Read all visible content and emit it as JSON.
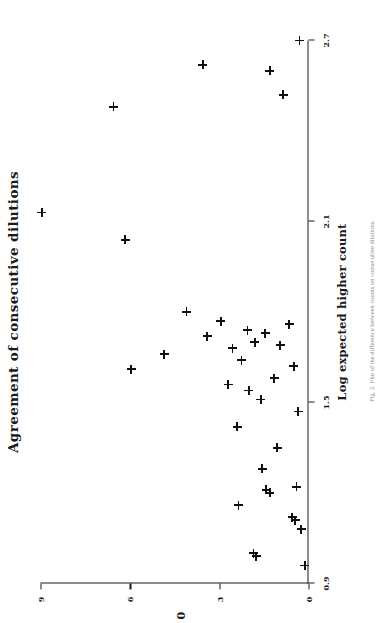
{
  "figure": {
    "title": "Agreement of consecutive dilutions",
    "x_axis_title": "Log expected higher count",
    "y_axis_title": "0",
    "caption_fragment": "Fig. 2. Plot of the difference between counts on consecutive dilutions."
  },
  "chart_data": {
    "type": "scatter",
    "title": "Agreement of consecutive dilutions",
    "xlabel": "Log expected higher count",
    "ylabel": "0",
    "xlim": [
      0.9,
      2.7
    ],
    "ylim": [
      0,
      9
    ],
    "xticks": [
      0.9,
      1.5,
      2.1,
      2.7
    ],
    "xticklabels": [
      "0.9",
      "1.5",
      "2.1",
      "2.7"
    ],
    "yticks": [
      0,
      3,
      6,
      9
    ],
    "yticklabels": [
      "0",
      "3",
      "6",
      "9"
    ],
    "grid": false,
    "legend": null,
    "marker": "plus",
    "marker_color": "#111111",
    "n_points": 38,
    "points": [
      {
        "x": 2.7,
        "y": 0.3
      },
      {
        "x": 2.62,
        "y": 3.55
      },
      {
        "x": 2.6,
        "y": 1.3
      },
      {
        "x": 2.52,
        "y": 0.85
      },
      {
        "x": 2.48,
        "y": 6.55
      },
      {
        "x": 2.13,
        "y": 8.95
      },
      {
        "x": 2.04,
        "y": 6.15
      },
      {
        "x": 1.8,
        "y": 4.1
      },
      {
        "x": 1.77,
        "y": 2.95
      },
      {
        "x": 1.76,
        "y": 0.65
      },
      {
        "x": 1.74,
        "y": 2.05
      },
      {
        "x": 1.73,
        "y": 1.45
      },
      {
        "x": 1.72,
        "y": 3.4
      },
      {
        "x": 1.7,
        "y": 1.8
      },
      {
        "x": 1.69,
        "y": 0.95
      },
      {
        "x": 1.68,
        "y": 2.55
      },
      {
        "x": 1.66,
        "y": 4.85
      },
      {
        "x": 1.64,
        "y": 2.25
      },
      {
        "x": 1.62,
        "y": 0.5
      },
      {
        "x": 1.61,
        "y": 5.95
      },
      {
        "x": 1.58,
        "y": 1.15
      },
      {
        "x": 1.56,
        "y": 2.7
      },
      {
        "x": 1.54,
        "y": 2.0
      },
      {
        "x": 1.51,
        "y": 1.6
      },
      {
        "x": 1.47,
        "y": 0.35
      },
      {
        "x": 1.42,
        "y": 2.4
      },
      {
        "x": 1.35,
        "y": 1.05
      },
      {
        "x": 1.28,
        "y": 1.55
      },
      {
        "x": 1.22,
        "y": 0.4
      },
      {
        "x": 1.21,
        "y": 1.42
      },
      {
        "x": 1.2,
        "y": 1.3
      },
      {
        "x": 1.16,
        "y": 2.35
      },
      {
        "x": 1.12,
        "y": 0.55
      },
      {
        "x": 1.11,
        "y": 0.45
      },
      {
        "x": 1.08,
        "y": 0.25
      },
      {
        "x": 1.0,
        "y": 1.85
      },
      {
        "x": 0.99,
        "y": 1.75
      },
      {
        "x": 0.96,
        "y": 0.12
      }
    ]
  }
}
